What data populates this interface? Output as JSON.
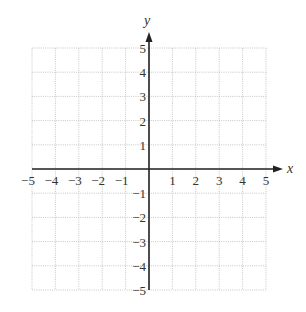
{
  "chart_data": {
    "type": "scatter",
    "title": "",
    "xlabel": "x",
    "ylabel": "y",
    "xlim": [
      -5,
      5
    ],
    "ylim": [
      -5,
      5
    ],
    "grid": true,
    "grid_style": "dotted",
    "x_ticks": [
      "−5",
      "−4",
      "−3",
      "−2",
      "−1",
      "1",
      "2",
      "3",
      "4",
      "5"
    ],
    "y_ticks": [
      "5",
      "4",
      "3",
      "2",
      "1",
      "−1",
      "−2",
      "−3",
      "−4",
      "−5"
    ],
    "series": [],
    "legend": null
  },
  "labels": {
    "x_axis": "x",
    "y_axis": "y"
  }
}
